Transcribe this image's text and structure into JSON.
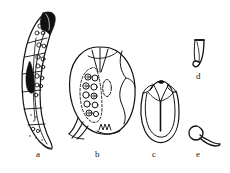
{
  "plate": {
    "title": "Comparative morphology plate",
    "background_color": "#ffffff",
    "ink_color": "#111111",
    "width": 230,
    "height": 173
  },
  "panels": [
    {
      "id": "a",
      "label": "a",
      "name": "elongate-curved-segmented-specimen",
      "description": "Elongate sickle-shaped body, darkly pigmented apical cap, internally partitioned into compartments containing rounded granules",
      "label_x": 36,
      "label_y": 150
    },
    {
      "id": "b",
      "label": "b",
      "name": "ovoid-specimen-with-granule-cluster",
      "description": "Broad ovoid cell bearing an apical notch, a lateral cluster of circular granules, an elongate central vacuole and a basal fringe of short processes",
      "label_x": 95,
      "label_y": 150
    },
    {
      "id": "c",
      "label": "c",
      "name": "u-shaped-specimen-with-central-stem",
      "description": "Narrow U-shaped outline with paired apical lobes and a straight median stem descending from the apex",
      "label_x": 152,
      "label_y": 150
    },
    {
      "id": "d",
      "label": "d",
      "name": "hook-shaped-specimen",
      "description": "Small slender hook-shaped element, broad at the top and tapering to a recurved tip",
      "label_x": 196,
      "label_y": 72
    },
    {
      "id": "e",
      "label": "e",
      "name": "tadpole-shaped-specimen",
      "description": "Minute tadpole-shaped element with a rounded head and a tapering curved tail",
      "label_x": 196,
      "label_y": 150
    }
  ],
  "icons": {
    "panel_label_role": "figure-panel-letter"
  }
}
